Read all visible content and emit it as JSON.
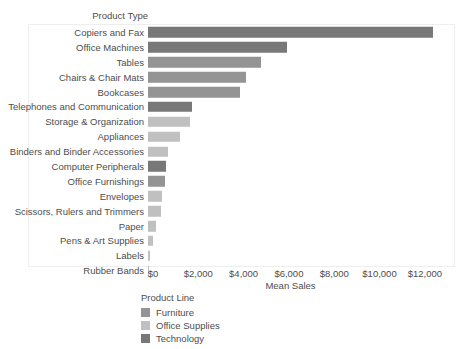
{
  "chart_data": {
    "type": "bar",
    "orientation": "horizontal",
    "title": "",
    "xlabel": "Mean Sales",
    "ylabel": "Product Type",
    "categories": [
      "Copiers and Fax",
      "Office Machines",
      "Tables",
      "Chairs & Chair Mats",
      "Bookcases",
      "Telephones and Communication",
      "Storage & Organization",
      "Appliances",
      "Binders and Binder Accessories",
      "Computer Peripherals",
      "Office Furnishings",
      "Envelopes",
      "Scissors, Rulers and Trimmers",
      "Paper",
      "Pens & Art Supplies",
      "Labels",
      "Rubber Bands"
    ],
    "values": [
      12600,
      6150,
      4980,
      4330,
      4060,
      1930,
      1860,
      1400,
      880,
      800,
      730,
      620,
      570,
      350,
      210,
      110,
      40
    ],
    "groups": [
      "Technology",
      "Technology",
      "Furniture",
      "Furniture",
      "Furniture",
      "Technology",
      "Office Supplies",
      "Office Supplies",
      "Office Supplies",
      "Technology",
      "Furniture",
      "Office Supplies",
      "Office Supplies",
      "Office Supplies",
      "Office Supplies",
      "Office Supplies",
      "Office Supplies"
    ],
    "xticks": [
      "$0",
      "$2,000",
      "$4,000",
      "$6,000",
      "$8,000",
      "$10,000",
      "$12,000"
    ],
    "xtick_values": [
      0,
      2000,
      4000,
      6000,
      8000,
      10000,
      12000
    ],
    "xlim": [
      0,
      13200
    ],
    "grid": false,
    "legend": {
      "title": "Product Line",
      "position": "bottom-left",
      "entries": [
        {
          "label": "Furniture",
          "color": "#949494"
        },
        {
          "label": "Office Supplies",
          "color": "#c0c0c0"
        },
        {
          "label": "Technology",
          "color": "#787878"
        }
      ]
    },
    "colors": {
      "Furniture": "#949494",
      "Office Supplies": "#c0c0c0",
      "Technology": "#787878"
    }
  }
}
